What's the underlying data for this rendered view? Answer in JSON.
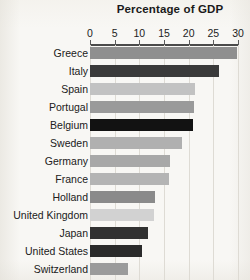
{
  "chart_data": {
    "type": "bar",
    "orientation": "horizontal",
    "title": "Percentage of GDP",
    "xlabel": "",
    "ylabel": "",
    "xlim": [
      0,
      30
    ],
    "grid": true,
    "legend": null,
    "tick_labels": [
      "0",
      "5",
      "10",
      "15",
      "20",
      "25",
      "30"
    ],
    "tick_values": [
      0,
      5,
      10,
      15,
      20,
      25,
      30
    ],
    "categories": [
      "Greece",
      "Italy",
      "Spain",
      "Portugal",
      "Belgium",
      "Sweden",
      "Germany",
      "France",
      "Holland",
      "United Kingdom",
      "Japan",
      "United States",
      "Switzerland"
    ],
    "values": [
      29.8,
      26.2,
      21.2,
      21.0,
      20.8,
      18.6,
      16.2,
      16.0,
      13.2,
      13.0,
      11.8,
      10.6,
      7.8
    ],
    "bar_colors": [
      "#8f8f8f",
      "#3a3a3a",
      "#c2c2c2",
      "#9a9a9a",
      "#121212",
      "#b0b0b0",
      "#a8a8a8",
      "#b4b4b4",
      "#8a8a8a",
      "#d2d2d2",
      "#313131",
      "#2b2b2b",
      "#9b9b9b"
    ]
  },
  "colors": {
    "page_background": "#f8f7f4",
    "axis": "#4a4a4a",
    "gridline": "#dedbd4",
    "text": "#1c1c1c"
  }
}
